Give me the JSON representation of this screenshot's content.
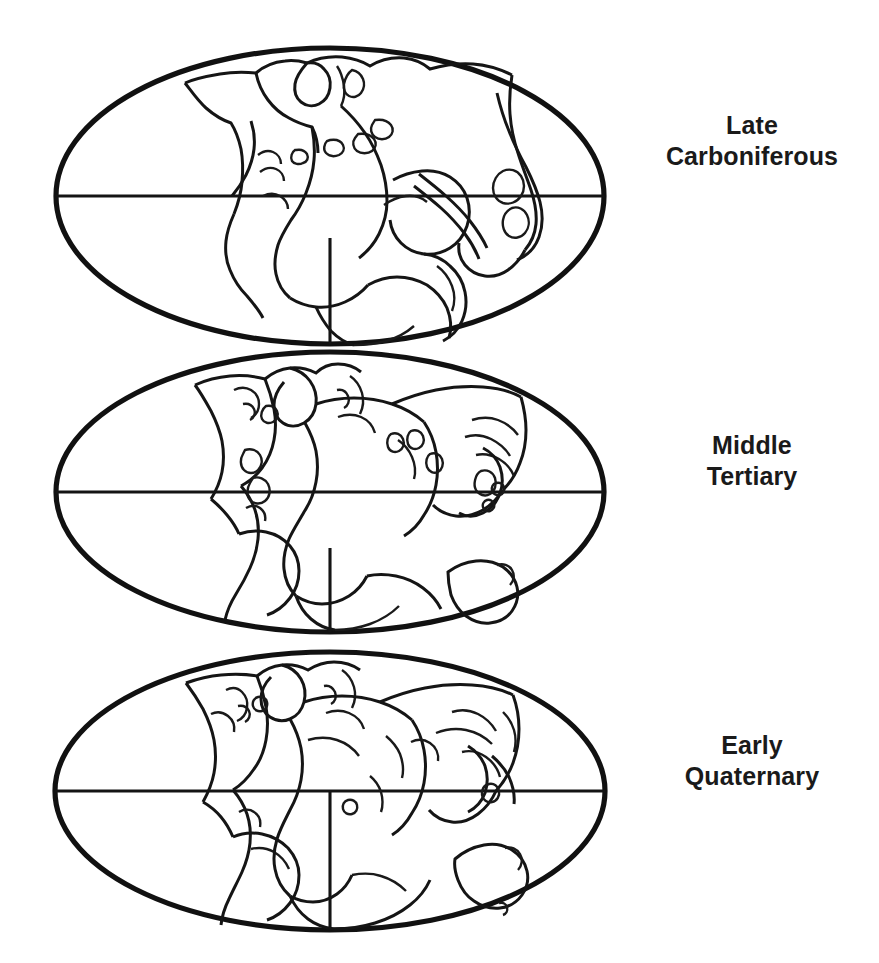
{
  "figure": {
    "background_color": "#ffffff",
    "line_color": "#151515",
    "projection": "Mollweide oval world map",
    "panel_count": 3,
    "bottom_edge_artifact": ""
  },
  "panels": [
    {
      "id": "late-carboniferous",
      "label_line_1": "Late",
      "label_line_2": "Carboniferous",
      "label_full": "Late Carboniferous",
      "ellipse": {
        "cx": 330,
        "cy": 196,
        "rx": 274,
        "ry": 148
      },
      "equator_y": 196,
      "meridian_x": 330,
      "description": "Pangaea supercontinent assembled, landmasses joined"
    },
    {
      "id": "middle-tertiary",
      "label_line_1": "Middle",
      "label_line_2": "Tertiary",
      "label_full": "Middle Tertiary",
      "ellipse": {
        "cx": 330,
        "cy": 492,
        "rx": 274,
        "ry": 140
      },
      "equator_y": 492,
      "meridian_x": 330,
      "description": "Atlantic ocean opened, continents partly separated"
    },
    {
      "id": "early-quaternary",
      "label_line_1": "Early",
      "label_line_2": "Quaternary",
      "label_full": "Early Quaternary",
      "ellipse": {
        "cx": 330,
        "cy": 791,
        "rx": 275,
        "ry": 139
      },
      "equator_y": 791,
      "meridian_x": 330,
      "description": "Near-modern continental positions, Australia separate"
    }
  ]
}
